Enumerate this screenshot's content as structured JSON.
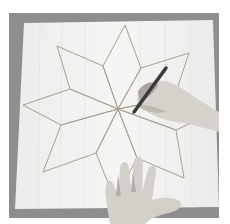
{
  "image": {
    "description": "Photograph of an eight-pointed star outline drawn on a sheet of paper; one hand holds a pencil tracing a line near the center while another hand steadies the paper at the bottom.",
    "colors": {
      "background": "#ffffff",
      "board": "#8e8e8e",
      "paper": "#f2f2f0",
      "star_line": "#a89f92",
      "skin": "#d6d2cc",
      "skin_shadow": "#a9a49d",
      "pencil": "#3a3a3a"
    }
  }
}
